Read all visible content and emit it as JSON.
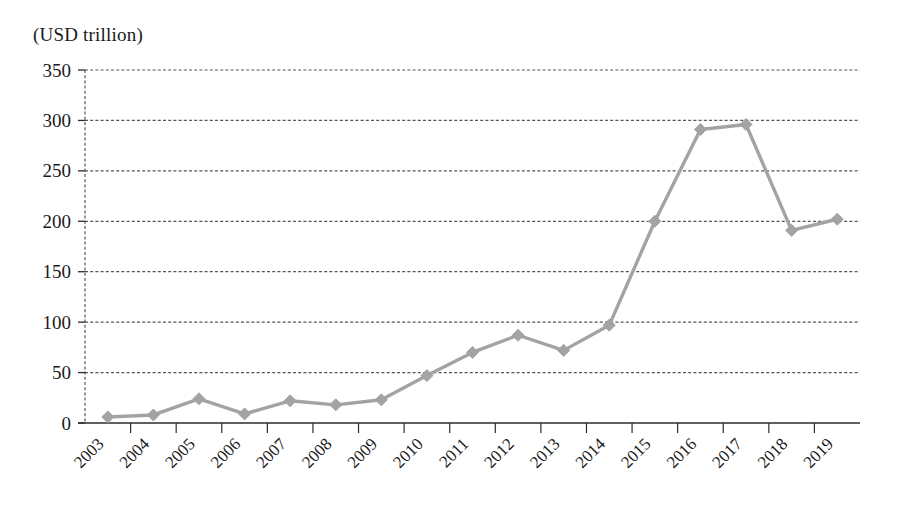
{
  "axis_unit_label": "(USD trillion)",
  "style": {
    "series_color": "#a3a3a3",
    "grid_color": "#555555",
    "axis_color": "#2b2b2b",
    "text_color": "#1a1a1a",
    "background": "#ffffff"
  },
  "chart_data": {
    "type": "line",
    "title": "",
    "subtitle": "",
    "xlabel": "",
    "ylabel": "(USD trillion)",
    "ylim": [
      0,
      350
    ],
    "ytick_step": 50,
    "yticks": [
      0,
      50,
      100,
      150,
      200,
      250,
      300,
      350
    ],
    "ytick_labels": [
      "0",
      "50",
      "100",
      "150",
      "200",
      "250",
      "300",
      "350"
    ],
    "grid": true,
    "grid_style": "dashed-horizontal",
    "legend": false,
    "legend_position": "none",
    "marker": "diamond",
    "categories": [
      "2003",
      "2004",
      "2005",
      "2006",
      "2007",
      "2008",
      "2009",
      "2010",
      "2011",
      "2012",
      "2013",
      "2014",
      "2015",
      "2016",
      "2017",
      "2018",
      "2019"
    ],
    "x": [
      2003,
      2004,
      2005,
      2006,
      2007,
      2008,
      2009,
      2010,
      2011,
      2012,
      2013,
      2014,
      2015,
      2016,
      2017,
      2018,
      2019
    ],
    "values": [
      6,
      8,
      24,
      9,
      22,
      18,
      23,
      47,
      70,
      87,
      72,
      97,
      200,
      291,
      296,
      191,
      202
    ],
    "series": [
      {
        "name": "",
        "values": [
          6,
          8,
          24,
          9,
          22,
          18,
          23,
          47,
          70,
          87,
          72,
          97,
          200,
          291,
          296,
          191,
          202
        ]
      }
    ]
  }
}
